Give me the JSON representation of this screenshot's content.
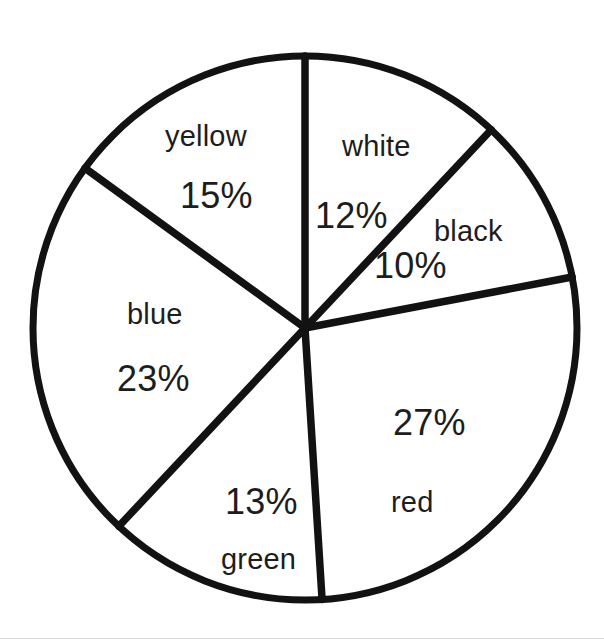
{
  "chart_data": {
    "type": "pie",
    "title": "",
    "subtitle": "",
    "xlabel": "",
    "ylabel": "",
    "legend_position": "none",
    "grid": false,
    "labels_inside_slices": true,
    "units": "percent",
    "total": 100,
    "categories": [
      "white",
      "black",
      "red",
      "green",
      "blue",
      "yellow"
    ],
    "values": [
      12,
      10,
      27,
      13,
      23,
      15
    ],
    "slices": [
      {
        "name": "white",
        "value": 12,
        "value_label": "12%",
        "fill": "#ffffff",
        "start_angle_deg": 0,
        "end_angle_deg": 43.2,
        "label_position": "upper-right"
      },
      {
        "name": "black",
        "value": 10,
        "value_label": "10%",
        "fill": "#ffffff",
        "start_angle_deg": 43.2,
        "end_angle_deg": 79.2,
        "label_position": "right-upper"
      },
      {
        "name": "red",
        "value": 27,
        "value_label": "27%",
        "fill": "#ffffff",
        "start_angle_deg": 79.2,
        "end_angle_deg": 176.4,
        "label_position": "lower-right"
      },
      {
        "name": "green",
        "value": 13,
        "value_label": "13%",
        "fill": "#ffffff",
        "start_angle_deg": 176.4,
        "end_angle_deg": 223.2,
        "label_position": "bottom"
      },
      {
        "name": "blue",
        "value": 23,
        "value_label": "23%",
        "fill": "#ffffff",
        "start_angle_deg": 223.2,
        "end_angle_deg": 306.0,
        "label_position": "left"
      },
      {
        "name": "yellow",
        "value": 15,
        "value_label": "15%",
        "fill": "#ffffff",
        "start_angle_deg": 306.0,
        "end_angle_deg": 360.0,
        "label_position": "upper-left"
      }
    ],
    "style": {
      "outline_color": "#121212",
      "divider_color": "#121212",
      "slice_fill": "#ffffff",
      "background": "#ffffff",
      "text_color": "#1d1d1d"
    },
    "geometry": {
      "center_x": 305,
      "center_y": 328,
      "radius": 272
    }
  },
  "labels": {
    "yellow": {
      "name": "yellow",
      "value": "15%"
    },
    "white": {
      "name": "white",
      "value": "12%"
    },
    "black": {
      "name": "black",
      "value": "10%"
    },
    "red": {
      "name": "red",
      "value": "27%"
    },
    "green": {
      "name": "green",
      "value": "13%"
    },
    "blue": {
      "name": "blue",
      "value": "23%"
    }
  }
}
